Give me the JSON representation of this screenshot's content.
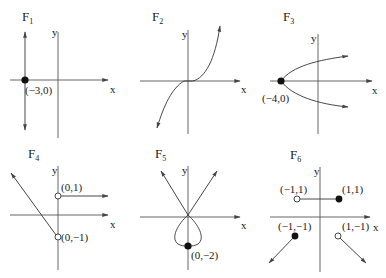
{
  "figure": {
    "panels": [
      {
        "id": "F1",
        "title": "F",
        "sub": "1",
        "axis_y": "y",
        "axis_x": "x",
        "description": "vertical line x = -3",
        "points": [
          {
            "label": "(−3,0)",
            "type": "filled"
          }
        ]
      },
      {
        "id": "F2",
        "title": "F",
        "sub": "2",
        "axis_y": "y",
        "axis_x": "x",
        "description": "cubic-like curve through origin",
        "points": []
      },
      {
        "id": "F3",
        "title": "F",
        "sub": "3",
        "axis_y": "y",
        "axis_x": "x",
        "description": "sideways parabola opening right, vertex (-4,0)",
        "points": [
          {
            "label": "(−4,0)",
            "type": "filled"
          }
        ]
      },
      {
        "id": "F4",
        "title": "F",
        "sub": "4",
        "axis_y": "y",
        "axis_x": "x",
        "description": "piecewise: decreasing line ending at (0,-1) open, horizontal ray from (0,1) open",
        "points": [
          {
            "label": "(0,1)",
            "type": "open"
          },
          {
            "label": "(0,−1)",
            "type": "open"
          }
        ]
      },
      {
        "id": "F5",
        "title": "F",
        "sub": "5",
        "axis_y": "y",
        "axis_x": "x",
        "description": "two crossing rays through origin with loop down to (0,-2)",
        "points": [
          {
            "label": "(0,−2)",
            "type": "filled"
          }
        ]
      },
      {
        "id": "F6",
        "title": "F",
        "sub": "6",
        "axis_y": "y",
        "axis_x": "x",
        "description": "piecewise: segment from (-1,1) open to (1,1) filled, rays from (-1,-1) filled and (1,-1) open",
        "points": [
          {
            "label": "(−1,1)",
            "type": "open"
          },
          {
            "label": "(1,1)",
            "type": "filled"
          },
          {
            "label": "(−1,−1)",
            "type": "filled"
          },
          {
            "label": "(1,−1)",
            "type": "open"
          }
        ]
      }
    ]
  }
}
